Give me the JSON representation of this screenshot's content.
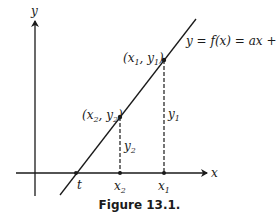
{
  "figure": {
    "caption": "Figure 13.1.",
    "axes": {
      "x_label": "x",
      "y_label": "y"
    },
    "line_label": "y = f(x) = ax + b",
    "points": [
      {
        "id": "p1",
        "label": "(x1, y1)",
        "x_tick": "x1",
        "height_label": "y1"
      },
      {
        "id": "p2",
        "label": "(x2, y2)",
        "x_tick": "x2",
        "height_label": "y2"
      }
    ],
    "x_intercept_label": "t",
    "colors": {
      "ink": "#1a1a1a",
      "background": "#ffffff"
    }
  }
}
